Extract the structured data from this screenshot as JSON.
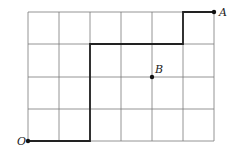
{
  "diagram": {
    "grid": {
      "cols": 6,
      "rows": 4,
      "x_lines": [
        28,
        59,
        90,
        121,
        152,
        183,
        214
      ],
      "y_lines": [
        12,
        44,
        77,
        109,
        141
      ],
      "line_color": "#7a7a7a"
    },
    "path": {
      "points": [
        [
          28,
          141
        ],
        [
          90,
          141
        ],
        [
          90,
          44
        ],
        [
          183,
          44
        ],
        [
          183,
          12
        ],
        [
          214,
          12
        ]
      ],
      "color": "#222222"
    },
    "points": [
      {
        "label": "O",
        "x": 28,
        "y": 141,
        "label_x": 17,
        "label_y": 145
      },
      {
        "label": "A",
        "x": 214,
        "y": 12,
        "label_x": 219,
        "label_y": 16
      },
      {
        "label": "B",
        "x": 152,
        "y": 77,
        "label_x": 155,
        "label_y": 73
      }
    ]
  }
}
